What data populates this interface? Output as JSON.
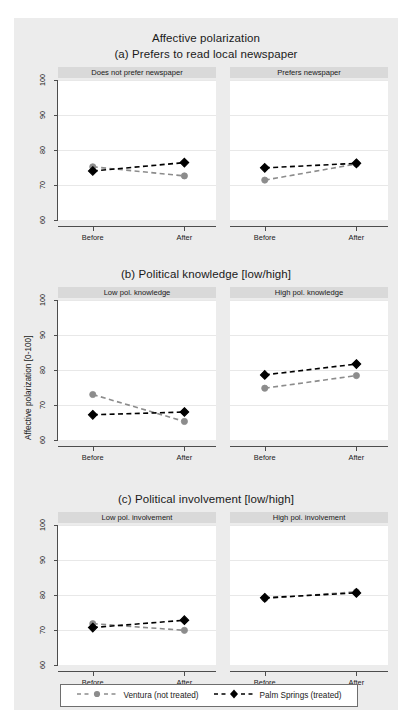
{
  "figure": {
    "title": "Affective polarization",
    "background_color": "#ececec",
    "plot_background_color": "#ffffff",
    "strip_background_color": "#d9d9d9"
  },
  "axis": {
    "ylabel": "Affective polarization [0-100]",
    "yticks": [
      "60",
      "70",
      "80",
      "90",
      "100"
    ],
    "ymin": 60,
    "ymax": 100,
    "xticks": [
      "Before",
      "After"
    ]
  },
  "legend": {
    "items": [
      {
        "label": "Ventura (not treated)",
        "color": "#8c8c8c",
        "marker": "circle"
      },
      {
        "label": "Palm Springs (treated)",
        "color": "#000000",
        "marker": "diamond"
      }
    ]
  },
  "panels": [
    {
      "caption": "(a) Prefers to read local newspaper",
      "facets": [
        {
          "strip": "Does not prefer newspaper"
        },
        {
          "strip": "Prefers newspaper"
        }
      ]
    },
    {
      "caption": "(b) Political knowledge [low/high]",
      "facets": [
        {
          "strip": "Low pol. knowledge"
        },
        {
          "strip": "High pol. knowledge"
        }
      ]
    },
    {
      "caption": "(c) Political involvement [low/high]",
      "facets": [
        {
          "strip": "Low pol. involvement"
        },
        {
          "strip": "High pol. involvement"
        }
      ]
    }
  ],
  "chart_data": {
    "type": "line",
    "title": "Affective polarization",
    "xlabel": "",
    "ylabel": "Affective polarization [0-100]",
    "ylim": [
      60,
      100
    ],
    "yticks": [
      60,
      70,
      80,
      90,
      100
    ],
    "x": [
      "Before",
      "After"
    ],
    "grid": true,
    "legend_position": "bottom",
    "panels": [
      {
        "caption": "(a) Prefers to read local newspaper",
        "facets": [
          {
            "name": "Does not prefer newspaper",
            "series": [
              {
                "name": "Ventura (not treated)",
                "values": [
                  75.2,
                  72.6
                ]
              },
              {
                "name": "Palm Springs (treated)",
                "values": [
                  74.0,
                  76.4
                ]
              }
            ]
          },
          {
            "name": "Prefers newspaper",
            "series": [
              {
                "name": "Ventura (not treated)",
                "values": [
                  71.4,
                  76.0
                ]
              },
              {
                "name": "Palm Springs (treated)",
                "values": [
                  74.9,
                  76.2
                ]
              }
            ]
          }
        ]
      },
      {
        "caption": "(b) Political knowledge [low/high]",
        "facets": [
          {
            "name": "Low pol. knowledge",
            "series": [
              {
                "name": "Ventura (not treated)",
                "values": [
                  73.0,
                  65.3
                ]
              },
              {
                "name": "Palm Springs (treated)",
                "values": [
                  67.2,
                  68.0
                ]
              }
            ]
          },
          {
            "name": "High pol. knowledge",
            "series": [
              {
                "name": "Ventura (not treated)",
                "values": [
                  74.8,
                  78.4
                ]
              },
              {
                "name": "Palm Springs (treated)",
                "values": [
                  78.6,
                  81.7
                ]
              }
            ]
          }
        ]
      },
      {
        "caption": "(c) Political involvement [low/high]",
        "facets": [
          {
            "name": "Low pol. involvement",
            "series": [
              {
                "name": "Ventura (not treated)",
                "values": [
                  71.8,
                  69.9
                ]
              },
              {
                "name": "Palm Springs (treated)",
                "values": [
                  70.7,
                  72.8
                ]
              }
            ]
          },
          {
            "name": "High pol. involvement",
            "series": [
              {
                "name": "Ventura (not treated)",
                "values": [
                  79.0,
                  80.9
                ]
              },
              {
                "name": "Palm Springs (treated)",
                "values": [
                  79.2,
                  80.6
                ]
              }
            ]
          }
        ]
      }
    ]
  }
}
